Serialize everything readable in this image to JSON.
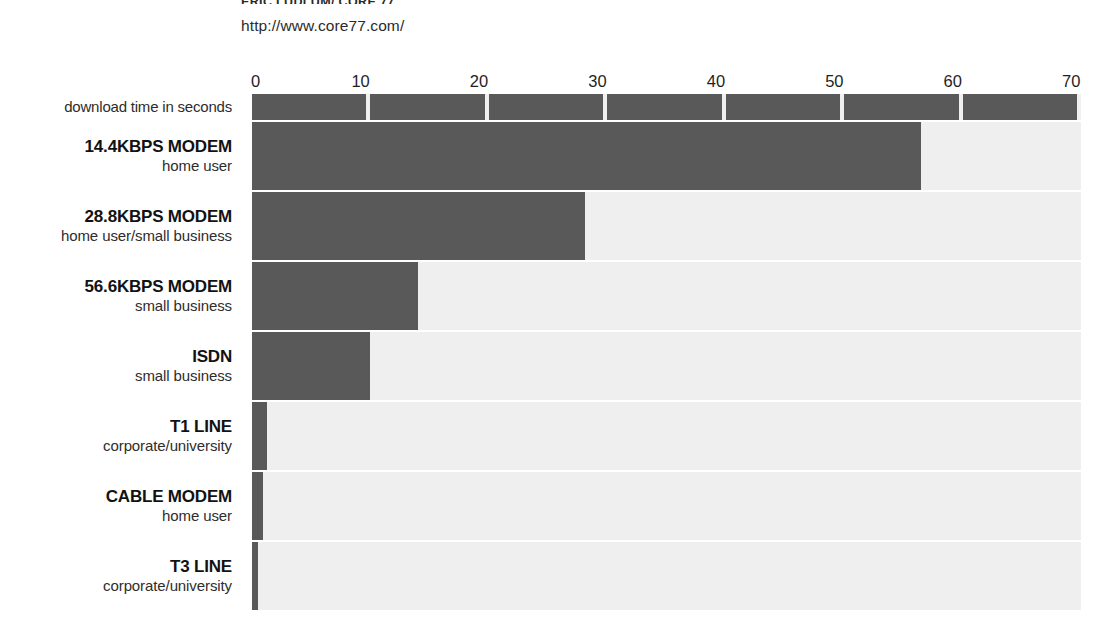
{
  "header": {
    "credit": "ERIC LUDLUM/ CORE 77",
    "url": "http://www.core77.com/"
  },
  "axis": {
    "label": "download time in seconds",
    "ticks": [
      "0",
      "10",
      "20",
      "30",
      "40",
      "50",
      "60",
      "70"
    ],
    "min": 0,
    "max": 70
  },
  "colors": {
    "bar": "#595959",
    "track": "#efefef",
    "page": "#ffffff",
    "text": "#1d1d1d"
  },
  "chart_data": {
    "type": "bar",
    "orientation": "horizontal",
    "title": "",
    "subtitle": "",
    "xlabel": "download time in seconds",
    "ylabel": "",
    "xlim": [
      0,
      70
    ],
    "xticks": [
      0,
      10,
      20,
      30,
      40,
      50,
      60,
      70
    ],
    "grid": false,
    "legend": "none",
    "categories": [
      "14.4KBPS MODEM",
      "28.8KBPS MODEM",
      "56.6KBPS MODEM",
      "ISDN",
      "T1 LINE",
      "CABLE MODEM",
      "T3 LINE"
    ],
    "category_sublabels": [
      "home user",
      "home user/small business",
      "small business",
      "small business",
      "corporate/university",
      "home user",
      "corporate/university"
    ],
    "values": [
      56.5,
      28.1,
      14.0,
      10.0,
      1.3,
      0.9,
      0.5
    ],
    "units": "seconds"
  },
  "rows": [
    {
      "title": "14.4KBPS MODEM",
      "sub": "home user",
      "value": 56.5
    },
    {
      "title": "28.8KBPS MODEM",
      "sub": "home user/small business",
      "value": 28.1
    },
    {
      "title": "56.6KBPS MODEM",
      "sub": "small business",
      "value": 14.0
    },
    {
      "title": "ISDN",
      "sub": "small business",
      "value": 10.0
    },
    {
      "title": "T1 LINE",
      "sub": "corporate/university",
      "value": 1.3
    },
    {
      "title": "CABLE MODEM",
      "sub": "home user",
      "value": 0.9
    },
    {
      "title": "T3 LINE",
      "sub": "corporate/university",
      "value": 0.5
    }
  ]
}
